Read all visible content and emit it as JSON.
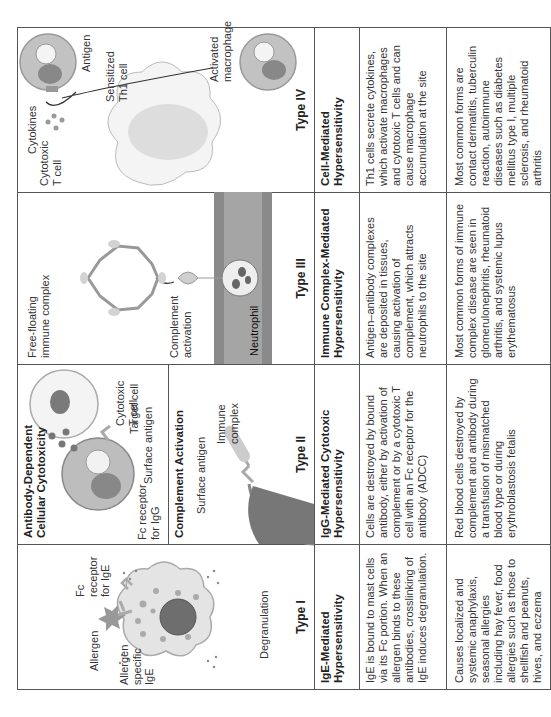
{
  "table": {
    "columns": [
      {
        "type": "Type I",
        "name": "IgE-Mediated Hypersensitivity",
        "mechanism": "IgE is bound to mast cells via its Fc portion. When an allergen binds to these antibodies, crosslinking of IgE induces degranulation.",
        "examples": "Causes localized and systemic anaphylaxis, seasonal allergies including hay fever, food allergies such as those to shellfish and peanuts, hives, and eczema",
        "figure_labels": {
          "allergen": "Allergen",
          "allergen_specific_ige": "Allergen specific IgE",
          "fc_receptor": "Fc receptor for IgE",
          "degranulation": "Degranulation"
        }
      },
      {
        "type": "Type II",
        "name": "IgG-Mediated Cytotoxic Hypersensitivity",
        "mechanism": "Cells are destroyed by bound antibody, either by activation of complement or by a cytotoxic T cell with an Fc receptor for the antibody (ADCC)",
        "examples": "Red blood cells destroyed by complement and antibody during a transfusion of mismatched blood type or during erythroblastosis fetalis",
        "figure_labels": {
          "adcc_title": "Antibody-Dependent Cellular Cytotoxicity",
          "cytotoxic_t_cell": "Cytotoxic T cell",
          "fc_receptor": "Fc receptor for IgG",
          "surface_antigen": "Surface antigen",
          "target_cell": "Target cell",
          "complement_title": "Complement Activation",
          "surface_antigen_2": "Surface antigen",
          "immune_complex": "Immune complex"
        }
      },
      {
        "type": "Type III",
        "name": "Immune Complex-Mediated Hypersensitivity",
        "mechanism": "Antigen–antibody complexes are deposited in tissues, causing activation of complement, which attracts neutrophils to the site",
        "examples": "Most common forms of immune complex disease are seen in glomerulonephritis, rheumatoid arthritis, and systemic lupus erythematosus",
        "figure_labels": {
          "free_floating": "Free-floating immune complex",
          "complement_activation": "Complement activation",
          "neutrophil": "Neutrophil"
        }
      },
      {
        "type": "Type IV",
        "name": "Cell-Mediated Hypersensitivity",
        "mechanism": "Th1 cells secrete cytokines, which activate macrophages and cytotoxic T cells and can cause macrophage accumulation at the site",
        "examples": "Most common forms are contact dermatitis, tuberculin reaction, autoimmune diseases such as diabetes mellitus type I, multiple sclerosis, and rheumatoid arthritis",
        "figure_labels": {
          "antigen": "Antigen",
          "sensitized_th1": "Sensitized Th1 cell",
          "cytokines": "Cytokines",
          "cytotoxic_t_cell": "Cytotoxic T cell",
          "activated_macrophage": "Activated macrophage"
        }
      }
    ]
  }
}
